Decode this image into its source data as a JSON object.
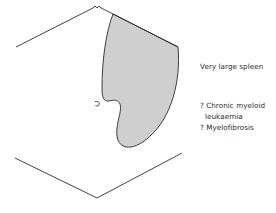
{
  "diagram": {
    "title": "Very large spleen",
    "differential": [
      {
        "prefix": "?",
        "text": "Chronic myeloid",
        "continuation": "leukaemia"
      },
      {
        "prefix": "?",
        "text": "Myelofibrosis"
      }
    ],
    "labels": {
      "title_line": "Very large spleen",
      "dx1_line1": "? Chronic myeloid",
      "dx1_line2": "leukaemia",
      "dx2_line1": "? Myelofibrosis"
    },
    "colors": {
      "outline": "#2b2b2b",
      "spleen_fill": "#cfcfcf",
      "background": "#ffffff"
    },
    "elements": {
      "costal_margin": "upper chevron outline",
      "pelvic_outline": "lower chevron outline",
      "umbilicus": "umbilicus marker",
      "spleen": "shaded enlarged spleen"
    }
  }
}
